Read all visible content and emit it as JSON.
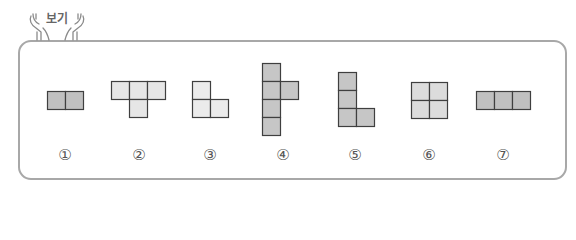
{
  "header": {
    "badge_text": "보기",
    "badge_icon": "hands-holding-icon"
  },
  "border_color": "#a8a8a8",
  "cell_stroke": "#3f3f3f",
  "options": [
    {
      "label": "①",
      "color": "#c0c0c0",
      "cells": [
        [
          0,
          0
        ],
        [
          1,
          0
        ]
      ],
      "description": "domino (2 squares horizontal)"
    },
    {
      "label": "②",
      "color": "#e6e6e6",
      "cells": [
        [
          0,
          0
        ],
        [
          1,
          0
        ],
        [
          2,
          0
        ],
        [
          1,
          1
        ]
      ],
      "description": "T-tetromino"
    },
    {
      "label": "③",
      "color": "#ebebeb",
      "cells": [
        [
          0,
          0
        ],
        [
          0,
          1
        ],
        [
          1,
          1
        ]
      ],
      "description": "L-tromino"
    },
    {
      "label": "④",
      "color": "#c6c6c6",
      "cells": [
        [
          0,
          0
        ],
        [
          0,
          1
        ],
        [
          1,
          1
        ],
        [
          0,
          2
        ],
        [
          0,
          3
        ]
      ],
      "description": "pentomino (4 vertical with one on right of second)"
    },
    {
      "label": "⑤",
      "color": "#c6c6c6",
      "cells": [
        [
          0,
          0
        ],
        [
          0,
          1
        ],
        [
          0,
          2
        ],
        [
          1,
          2
        ]
      ],
      "description": "L-tetromino"
    },
    {
      "label": "⑥",
      "color": "#dcdcdc",
      "cells": [
        [
          0,
          0
        ],
        [
          1,
          0
        ],
        [
          0,
          1
        ],
        [
          1,
          1
        ]
      ],
      "description": "O-tetromino (2x2 square)"
    },
    {
      "label": "⑦",
      "color": "#c0c0c0",
      "cells": [
        [
          0,
          0
        ],
        [
          1,
          0
        ],
        [
          2,
          0
        ]
      ],
      "description": "I-tromino (3 horizontal)"
    }
  ]
}
